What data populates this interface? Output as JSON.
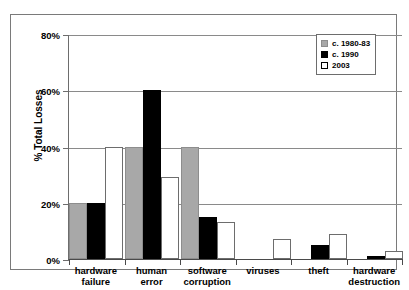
{
  "chart_data": {
    "type": "bar",
    "title": "",
    "xlabel": "",
    "ylabel": "% Total Losses",
    "ylim": [
      0,
      80
    ],
    "ytick_labels": [
      "0%",
      "20%",
      "40%",
      "60%",
      "80%"
    ],
    "ytick_values": [
      0,
      20,
      40,
      60,
      80
    ],
    "grid": true,
    "legend_position": "top-right",
    "categories": [
      "hardware\nfailure",
      "human\nerror",
      "software\ncorruption",
      "viruses",
      "theft",
      "hardware\ndestruction"
    ],
    "series": [
      {
        "name": "c. 1980-83",
        "values": [
          20,
          40,
          40,
          0,
          0,
          0
        ]
      },
      {
        "name": "c. 1990",
        "values": [
          20,
          60,
          15,
          0,
          5,
          1
        ]
      },
      {
        "name": "2003",
        "values": [
          40,
          29,
          13,
          7,
          9,
          3
        ]
      }
    ]
  },
  "legend": {
    "items": [
      {
        "label": "c. 1980-83"
      },
      {
        "label": "c. 1990"
      },
      {
        "label": "2003"
      }
    ]
  },
  "colors": {
    "series_0": "#a8a8a8",
    "series_1": "#000000",
    "series_2": "#ffffff",
    "axis": "#4a4a4a",
    "grid": "#8a8a8a",
    "frame": "#7a7a7a",
    "background": "#ffffff"
  }
}
